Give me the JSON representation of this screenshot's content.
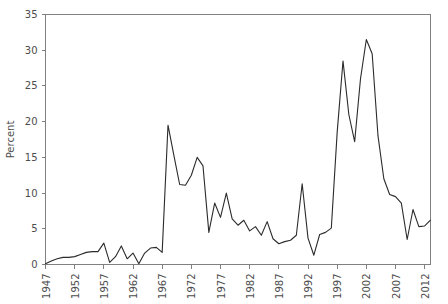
{
  "chart_data": {
    "type": "line",
    "title": "",
    "subtitle": "",
    "xlabel": "",
    "ylabel": "Percent",
    "xlim": [
      1947,
      2013
    ],
    "ylim": [
      0,
      35
    ],
    "grid": false,
    "legend": null,
    "legend_position": "none",
    "line_color": "#2b2b2b",
    "axis_color": "#808080",
    "text_color": "#4d4d4d",
    "y_ticks": [
      0,
      5,
      10,
      15,
      20,
      25,
      30,
      35
    ],
    "y_tick_labels": [
      "0",
      "5",
      "10",
      "15",
      "20",
      "25",
      "30",
      "35"
    ],
    "x_ticks": [
      1947,
      1952,
      1957,
      1962,
      1967,
      1972,
      1977,
      1982,
      1987,
      1992,
      1997,
      2002,
      2007,
      2012
    ],
    "x_tick_labels": [
      "1947",
      "1952",
      "1957",
      "1962",
      "1967",
      "1972",
      "1977",
      "1982",
      "1987",
      "1992",
      "1997",
      "2002",
      "2007",
      "2012"
    ],
    "x": [
      1947,
      1948,
      1949,
      1950,
      1951,
      1952,
      1953,
      1954,
      1955,
      1956,
      1957,
      1958,
      1959,
      1960,
      1961,
      1962,
      1963,
      1964,
      1965,
      1966,
      1967,
      1968,
      1969,
      1970,
      1971,
      1972,
      1973,
      1974,
      1975,
      1976,
      1977,
      1978,
      1979,
      1980,
      1981,
      1982,
      1983,
      1984,
      1985,
      1986,
      1987,
      1988,
      1989,
      1990,
      1991,
      1992,
      1993,
      1994,
      1995,
      1996,
      1997,
      1998,
      1999,
      2000,
      2001,
      2002,
      2003,
      2004,
      2005,
      2006,
      2007,
      2008,
      2009,
      2010,
      2011,
      2012,
      2013
    ],
    "values": [
      0.1,
      0.5,
      0.8,
      1.0,
      1.0,
      1.1,
      1.4,
      1.7,
      1.8,
      1.8,
      3.0,
      0.3,
      1.1,
      2.6,
      0.8,
      1.6,
      0.1,
      1.6,
      2.3,
      2.4,
      1.7,
      19.5,
      15.3,
      11.2,
      11.1,
      12.5,
      15.0,
      13.8,
      4.5,
      8.6,
      6.6,
      10.0,
      6.4,
      5.5,
      6.2,
      4.7,
      5.3,
      4.1,
      6.0,
      3.6,
      2.9,
      3.2,
      3.4,
      4.1,
      11.3,
      3.7,
      1.3,
      4.2,
      4.5,
      5.1,
      18.5,
      28.5,
      21.0,
      17.2,
      26.0,
      31.5,
      29.5,
      18.0,
      12.0,
      9.8,
      9.5,
      8.6,
      3.5,
      7.7,
      5.3,
      5.4,
      6.2
    ],
    "series_name": "Percent"
  }
}
